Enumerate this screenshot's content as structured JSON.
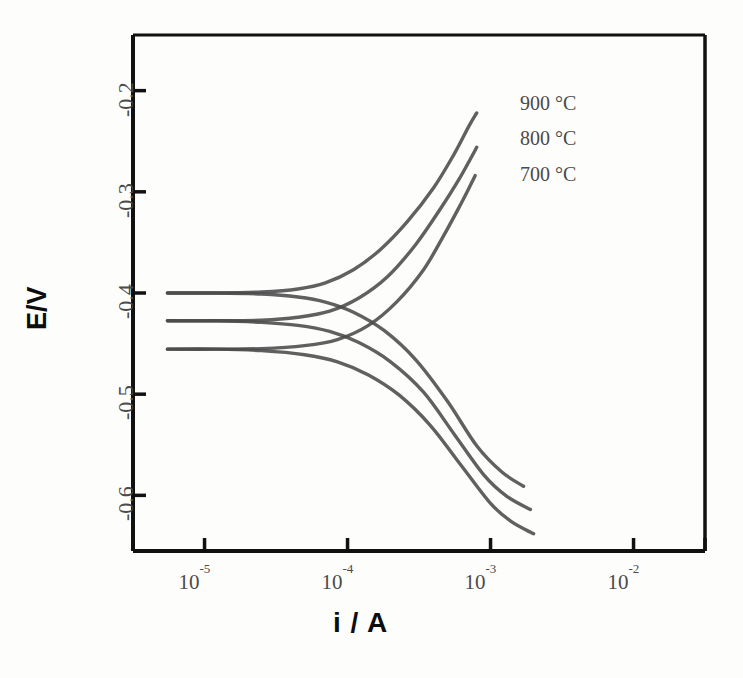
{
  "figure": {
    "background": "#fdfdfc",
    "curve_color": "#4a4a4a",
    "axis_color": "#111111"
  },
  "axes": {
    "x_title": "i / A",
    "y_title": "E/V",
    "x_tick_labels": [
      "10⁻⁵",
      "10⁻⁴",
      "10⁻³",
      "10⁻²"
    ],
    "x_tick_mantissa": [
      "10",
      "10",
      "10",
      "10"
    ],
    "x_tick_exponent": [
      "-5",
      "-4",
      "-3",
      "-2"
    ],
    "y_tick_labels": [
      "-0.2",
      "-0.3",
      "-0.4",
      "-0.5",
      "-0.6"
    ]
  },
  "annotations": {
    "series_labels": [
      "900 °C",
      "800 °C",
      "700 °C"
    ]
  },
  "chart_data": {
    "type": "line",
    "title": "",
    "xlabel": "i / A",
    "ylabel": "E/V",
    "xscale": "log",
    "xlim": [
      3.16e-06,
      0.0316
    ],
    "ylim": [
      -0.655,
      -0.145
    ],
    "grid": false,
    "legend": "inline-right",
    "xticks": [
      1e-05,
      0.0001,
      0.001,
      0.01
    ],
    "xticklabels": [
      "10⁻⁵",
      "10⁻⁴",
      "10⁻³",
      "10⁻²"
    ],
    "yticks": [
      -0.2,
      -0.3,
      -0.4,
      -0.5,
      -0.6
    ],
    "yticklabels": [
      "-0.2",
      "-0.3",
      "-0.4",
      "-0.5",
      "-0.6"
    ],
    "series": [
      {
        "name": "900 °C",
        "label": "900 °C",
        "open_circuit_potential": -0.4,
        "anodic_branch": {
          "x": [
            5.5e-06,
            1.2e-05,
            2.5e-05,
            4.5e-05,
            7e-05,
            0.00011,
            0.00017,
            0.00026,
            0.0004,
            0.00056,
            0.0007,
            0.0008
          ],
          "y": [
            -0.4,
            -0.4,
            -0.399,
            -0.396,
            -0.39,
            -0.377,
            -0.357,
            -0.33,
            -0.296,
            -0.262,
            -0.236,
            -0.222
          ]
        },
        "cathodic_branch": {
          "x": [
            5.5e-06,
            1.2e-05,
            2.5e-05,
            4.5e-05,
            7e-05,
            0.00011,
            0.00018,
            0.0003,
            0.0005,
            0.0008,
            0.0012,
            0.0017
          ],
          "y": [
            -0.4,
            -0.4,
            -0.401,
            -0.404,
            -0.409,
            -0.419,
            -0.437,
            -0.466,
            -0.507,
            -0.551,
            -0.577,
            -0.591
          ]
        }
      },
      {
        "name": "800 °C",
        "label": "800 °C",
        "open_circuit_potential": -0.4275,
        "anodic_branch": {
          "x": [
            5.5e-06,
            1.2e-05,
            2.5e-05,
            4.5e-05,
            7.5e-05,
            0.00012,
            0.00019,
            0.0003,
            0.00045,
            0.0006,
            0.00072,
            0.0008
          ],
          "y": [
            -0.4275,
            -0.4275,
            -0.427,
            -0.424,
            -0.418,
            -0.405,
            -0.384,
            -0.352,
            -0.316,
            -0.288,
            -0.268,
            -0.256
          ]
        },
        "cathodic_branch": {
          "x": [
            5.5e-06,
            1.2e-05,
            2.5e-05,
            4.5e-05,
            7.5e-05,
            0.00012,
            0.0002,
            0.00034,
            0.00056,
            0.0009,
            0.0013,
            0.0019
          ],
          "y": [
            -0.4275,
            -0.4275,
            -0.429,
            -0.432,
            -0.438,
            -0.449,
            -0.468,
            -0.498,
            -0.54,
            -0.58,
            -0.601,
            -0.614
          ]
        }
      },
      {
        "name": "700 °C",
        "label": "700 °C",
        "open_circuit_potential": -0.4555,
        "anodic_branch": {
          "x": [
            5.5e-06,
            1.2e-05,
            2.5e-05,
            5e-05,
            8.5e-05,
            0.00014,
            0.00022,
            0.00034,
            0.00048,
            0.00062,
            0.00072,
            0.00078
          ],
          "y": [
            -0.4555,
            -0.4555,
            -0.455,
            -0.452,
            -0.446,
            -0.432,
            -0.409,
            -0.377,
            -0.341,
            -0.312,
            -0.294,
            -0.284
          ]
        },
        "cathodic_branch": {
          "x": [
            5.5e-06,
            1.2e-05,
            2.5e-05,
            5e-05,
            8.5e-05,
            0.00014,
            0.00023,
            0.00038,
            0.00062,
            0.001,
            0.0014,
            0.002
          ],
          "y": [
            -0.4555,
            -0.4555,
            -0.457,
            -0.461,
            -0.468,
            -0.481,
            -0.501,
            -0.531,
            -0.57,
            -0.608,
            -0.626,
            -0.638
          ]
        }
      }
    ]
  }
}
